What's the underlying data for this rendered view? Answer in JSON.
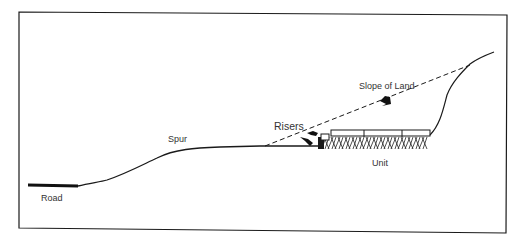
{
  "diagram": {
    "labels": {
      "road": "Road",
      "spur": "Spur",
      "risers": "Risers",
      "slope_of_land": "Slope of Land",
      "unit": "Unit"
    },
    "colors": {
      "ink": "#1a1a1a",
      "background": "#ffffff"
    }
  }
}
